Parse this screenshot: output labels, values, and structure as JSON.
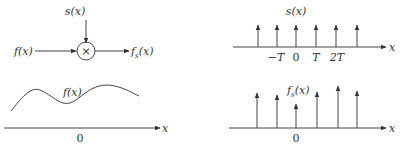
{
  "block_diagram": {
    "input_label": "f(x)",
    "modulator_label": "s(x)",
    "multiplier_symbol": "×",
    "output_label": "f_s(x)",
    "output_main": "f",
    "output_sub": "s",
    "output_tail": "(x)"
  },
  "continuous_signal": {
    "curve_label": "f(x)",
    "axis_label": "x",
    "origin_label": "0"
  },
  "sampling_comb": {
    "title": "s(x)",
    "axis_label": "x",
    "tick_labels": [
      "−T",
      "0",
      "T",
      "2T"
    ]
  },
  "sampled_signal": {
    "title_main": "f",
    "title_sub": "s",
    "title_tail": "(x)",
    "axis_label": "x",
    "origin_label": "0"
  },
  "colors": {
    "ink": "#444444",
    "background": "#ffffff"
  }
}
